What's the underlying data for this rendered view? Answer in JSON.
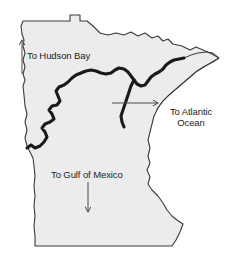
{
  "figure": {
    "name": "minnesota-watershed-divide-map",
    "background_color": "#ffffff",
    "state_fill_color": "#ececec",
    "state_outline_color": "#3a3a3a",
    "divide_line_color": "#1a1a1a",
    "label_text_color": "#1c1c1c",
    "arrow_color": "#4a4a4a"
  },
  "labels": {
    "hudson_bay": {
      "text": "To Hudson Bay",
      "arrow_direction": "up",
      "icon": "arrow-up-icon"
    },
    "atlantic_ocean": {
      "line1": "To Atlantic",
      "line2": "Ocean",
      "arrow_direction": "right",
      "icon": "arrow-right-icon"
    },
    "gulf_of_mexico": {
      "text": "To Gulf of Mexico",
      "arrow_direction": "down",
      "icon": "arrow-down-icon"
    }
  },
  "geometry": {
    "state_outline_path": "M 24 95 L 23 86 L 25 80 L 23 74 L 25 67 L 23 60 L 25 53 L 23 46 L 24 40 L 22 34 L 21 26 L 23 21 L 30 21 L 45 21 L 60 21 L 70 21 L 70 15 L 80 15 L 80 21 L 87 21 L 93 26 L 100 33 L 108 35 L 116 33 L 124 35 L 131 32 L 138 36 L 145 33 L 152 38 L 158 36 L 163 41 L 168 39 L 173 44 L 182 46 L 190 50 L 196 47 L 203 50 L 212 54 L 219 58 L 213 62 L 205 66 L 197 71 L 190 77 L 183 83 L 176 89 L 169 95 L 163 101 L 158 108 L 154 116 L 152 124 L 150 132 L 148 140 L 150 148 L 148 156 L 150 163 L 147 170 L 150 177 L 148 184 L 152 190 L 158 196 L 163 203 L 167 210 L 172 216 L 177 220 L 183 224 L 180 232 L 176 240 L 172 246 L 160 246 L 140 246 L 120 246 L 100 246 L 80 246 L 60 246 L 45 246 L 35 246 L 35 236 L 34 226 L 35 216 L 34 206 L 35 196 L 34 186 L 35 176 L 34 166 L 33 158 L 30 152 L 27 146 L 25 138 L 27 130 L 25 122 L 27 114 L 25 106 L 24 95 Z",
    "divide_line_path": "M 27 148 L 31 145 L 35 148 L 40 146 L 44 142 L 47 137 L 45 132 L 42 128 L 45 124 L 50 122 L 54 119 L 52 114 L 49 110 L 52 106 L 57 105 L 60 101 L 58 96 L 56 91 L 59 87 L 64 85 L 68 82 L 72 78 L 76 75 L 81 73 L 86 71 L 91 70 L 96 71 L 101 73 L 106 74 L 111 73 L 115 70 L 119 68 L 124 69 L 128 72 L 131 76 L 134 80 L 137 84 L 141 86 L 145 85 L 148 81 L 151 77 L 155 74 L 159 72 L 163 69 L 166 65 L 170 62 L 174 60 L 179 59 L 184 58",
    "divide_branch_path": "M 134 80 L 131 86 L 129 92 L 127 98 L 125 104 L 123 110 L 121 116 L 122 122 L 124 127",
    "lake_superior_shore_path": "M 184 58 L 191 55 L 198 53 L 206 52 L 213 53 L 219 58 L 212 62 L 204 67 L 196 72 L 189 78 L 182 84 L 175 90 L 168 96 L 162 102 L 157 109"
  },
  "arrows": {
    "hudson_bay": {
      "x1": 22,
      "y1": 74,
      "x2": 22,
      "y2": 40
    },
    "atlantic_ocean": {
      "x1": 112,
      "y1": 103,
      "x2": 158,
      "y2": 103
    },
    "gulf_of_mexico": {
      "x1": 88,
      "y1": 182,
      "x2": 88,
      "y2": 212
    }
  }
}
